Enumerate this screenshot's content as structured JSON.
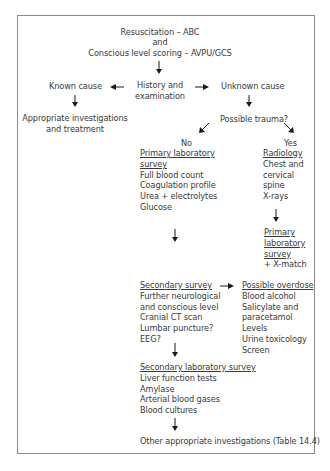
{
  "top": {
    "line1": "Resuscitation – ABC",
    "line2": "and",
    "line3": "Conscious level scoring – AVPU/GCS"
  },
  "history": {
    "line1": "History and",
    "line2": "examination"
  },
  "known_cause": {
    "label": "Known cause",
    "result_line1": "Appropriate investigations",
    "result_line2": "and treatment"
  },
  "unknown_cause": {
    "label": "Unknown cause"
  },
  "trauma": {
    "question": "Possible trauma?",
    "no_label": "No",
    "yes_label": "Yes"
  },
  "primary_lab_survey": {
    "title_line1": "Primary laboratory",
    "title_line2": "survey",
    "items": [
      "Full blood count",
      "Coagulation profile",
      "Urea + electrolytes",
      "Glucose"
    ]
  },
  "radiology": {
    "title": "Radiology",
    "items": [
      "Chest and",
      "cervical",
      "spine",
      "X-rays"
    ]
  },
  "primary_lab_survey_trauma": {
    "title_line1": "Primary",
    "title_line2": "laboratory",
    "title_line3": "survey",
    "extra": "+ X-match"
  },
  "secondary_survey": {
    "title": "Secondary survey",
    "items": [
      "Further neurological",
      "and conscious level",
      "Cranial CT scan",
      "Lumbar puncture?",
      "EEG?"
    ]
  },
  "possible_overdose": {
    "title": "Possible overdose",
    "items": [
      "Blood alcohol",
      "Salicylate and",
      "paracetamol",
      "Levels",
      "Urine toxicology",
      "Screen"
    ]
  },
  "secondary_lab_survey": {
    "title": "Secondary laboratory survey",
    "items": [
      "Liver function tests",
      "Amylase",
      "Arterial blood gases",
      "Blood cultures"
    ]
  },
  "final": {
    "label": "Other appropriate investigations (Table 14.4)"
  },
  "colors": {
    "border": "#8a8a8a",
    "text": "#3a3a3a",
    "arrow": "#1a1a1a"
  }
}
